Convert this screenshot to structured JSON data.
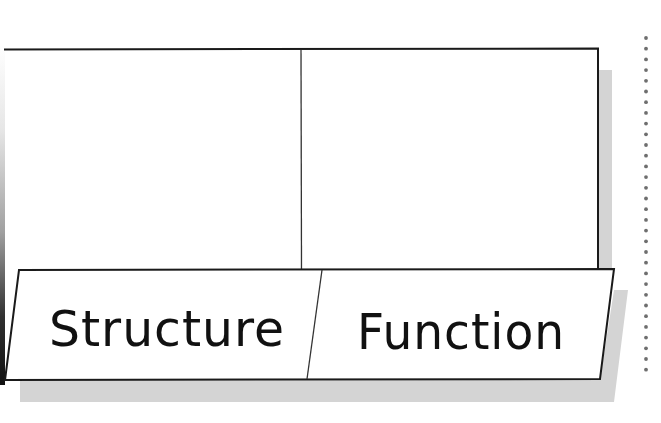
{
  "diagram": {
    "type": "foldable-organizer",
    "top_panels": [
      {
        "id": "left",
        "content": ""
      },
      {
        "id": "right",
        "content": ""
      }
    ],
    "tabs": [
      {
        "label": "Structure"
      },
      {
        "label": "Function"
      }
    ],
    "fold_guide": "dotted-line"
  },
  "colors": {
    "line": "#1a1a1a",
    "shadow": "#d4d4d4",
    "dot": "#6e6e6e",
    "background": "#ffffff",
    "text": "#111111"
  }
}
